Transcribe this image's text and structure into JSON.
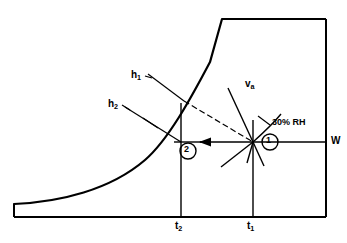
{
  "figure": {
    "type": "diagram"
  },
  "axes": {
    "x_tick_labels": [
      "t",
      "t"
    ],
    "x_ticks": [
      {
        "label_base": "t",
        "label_sub": "2",
        "name": "t2"
      },
      {
        "label_base": "t",
        "label_sub": "1",
        "name": "t1"
      }
    ],
    "y_axis_label": "W"
  },
  "labels": {
    "enthalpy_1": {
      "base": "h",
      "sub": "1"
    },
    "enthalpy_2": {
      "base": "h",
      "sub": "2"
    },
    "specific_volume": {
      "base": "v",
      "sub": "a"
    },
    "relative_humidity": "30% RH",
    "humidity_ratio": "W",
    "t2": {
      "base": "t",
      "sub": "2"
    },
    "t1": {
      "base": "t",
      "sub": "1"
    }
  },
  "state_points": [
    {
      "id": "1",
      "label": "1",
      "x": 253,
      "y": 142
    },
    {
      "id": "2",
      "label": "2",
      "x": 187,
      "y": 150
    }
  ],
  "colors": {
    "line": "#000000",
    "background": "#ffffff"
  }
}
